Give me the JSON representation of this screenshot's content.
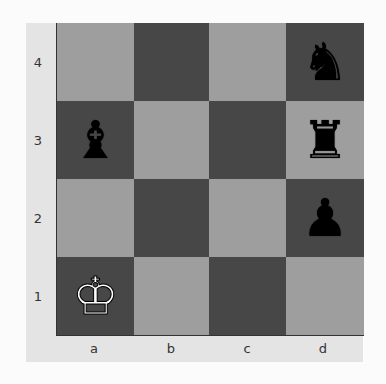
{
  "board": {
    "files": [
      "a",
      "b",
      "c",
      "d"
    ],
    "ranks": [
      "4",
      "3",
      "2",
      "1"
    ],
    "colors": {
      "light": "#9e9e9e",
      "dark": "#474747",
      "panel": "#e4e4e4"
    },
    "squares": [
      [
        {
          "id": "a4",
          "color": "light",
          "piece": ""
        },
        {
          "id": "b4",
          "color": "dark",
          "piece": ""
        },
        {
          "id": "c4",
          "color": "light",
          "piece": ""
        },
        {
          "id": "d4",
          "color": "dark",
          "piece": "♞",
          "piece_name": "black-knight",
          "side": "black"
        }
      ],
      [
        {
          "id": "a3",
          "color": "dark",
          "piece": "♝",
          "piece_name": "black-bishop",
          "side": "black"
        },
        {
          "id": "b3",
          "color": "light",
          "piece": ""
        },
        {
          "id": "c3",
          "color": "dark",
          "piece": ""
        },
        {
          "id": "d3",
          "color": "light",
          "piece": "♜",
          "piece_name": "black-rook",
          "side": "black"
        }
      ],
      [
        {
          "id": "a2",
          "color": "light",
          "piece": ""
        },
        {
          "id": "b2",
          "color": "dark",
          "piece": ""
        },
        {
          "id": "c2",
          "color": "light",
          "piece": ""
        },
        {
          "id": "d2",
          "color": "dark",
          "piece": "♟",
          "piece_name": "black-pawn",
          "side": "black"
        }
      ],
      [
        {
          "id": "a1",
          "color": "dark",
          "piece": "♔",
          "piece_name": "white-king",
          "side": "white"
        },
        {
          "id": "b1",
          "color": "light",
          "piece": ""
        },
        {
          "id": "c1",
          "color": "dark",
          "piece": ""
        },
        {
          "id": "d1",
          "color": "light",
          "piece": ""
        }
      ]
    ]
  }
}
